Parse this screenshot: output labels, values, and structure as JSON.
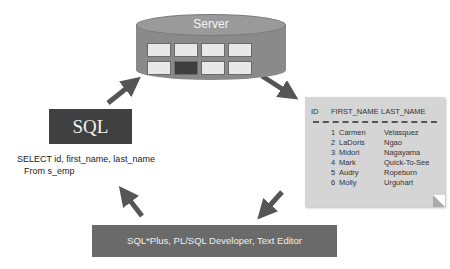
{
  "server": {
    "label": "Server",
    "slots": [
      {
        "state": "light"
      },
      {
        "state": "light"
      },
      {
        "state": "light"
      },
      {
        "state": "light"
      },
      {
        "state": "light"
      },
      {
        "state": "dark"
      },
      {
        "state": "light"
      },
      {
        "state": "light"
      }
    ]
  },
  "sql": {
    "label": "SQL",
    "query_line1": "SELECT id, first_name, last_name",
    "query_line2": "From s_emp"
  },
  "result": {
    "columns": [
      "ID",
      "FIRST_NAME",
      "LAST_NAME"
    ],
    "rows": [
      {
        "id": "1",
        "first_name": "Carmen",
        "last_name": "Velasquez"
      },
      {
        "id": "2",
        "first_name": "LaDoris",
        "last_name": "Ngao"
      },
      {
        "id": "3",
        "first_name": "Midori",
        "last_name": "Nagayama"
      },
      {
        "id": "4",
        "first_name": "Mark",
        "last_name": "Quick-To-See"
      },
      {
        "id": "5",
        "first_name": "Audry",
        "last_name": "Ropeburn"
      },
      {
        "id": "6",
        "first_name": "Molly",
        "last_name": "Urguhart"
      }
    ]
  },
  "tools": {
    "label": "SQL*Plus, PL/SQL Developer, Text Editor"
  },
  "colors": {
    "arrow": "#555555",
    "sql_box": "#404040",
    "tools_bar": "#6a6a6a",
    "sheet": "#d5d5d5"
  }
}
